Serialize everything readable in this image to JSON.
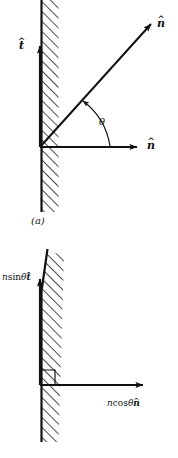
{
  "figure": {
    "caption_a": "(a)",
    "panels": [
      {
        "id": "panel-a",
        "name": "normal-vector-and-angle-diagram",
        "caption": "(a)",
        "wall": {
          "name": "hatched-wall",
          "orientation": "vertical",
          "hatch_angle_deg": 45,
          "line_color": "#111111"
        },
        "vectors": [
          {
            "name": "tangent-unit-vector",
            "label_base": "t",
            "label_accent": "^",
            "direction": "up",
            "from": [
              40,
              147
            ],
            "to": [
              40,
              42
            ]
          },
          {
            "name": "normal-unit-vector",
            "label_base": "n",
            "label_accent": "^",
            "direction": "right",
            "from": [
              40,
              147
            ],
            "to": [
              142,
              147
            ]
          },
          {
            "name": "oblique-normal-vector",
            "label_base": "n",
            "label_accent": "^",
            "direction": "up-right",
            "from": [
              40,
              147
            ],
            "to": [
              155,
              20
            ],
            "angle_deg": 48
          }
        ],
        "angle_marker": {
          "name": "theta-arc",
          "label": "θ",
          "between": [
            "normal-unit-vector",
            "oblique-normal-vector"
          ],
          "value_deg": 48
        }
      },
      {
        "id": "panel-b",
        "name": "component-decomposition-diagram",
        "caption": "",
        "wall": {
          "name": "hatched-wall",
          "orientation": "vertical",
          "hatch_angle_deg": 45,
          "line_color": "#111111"
        },
        "right_angle_marker": {
          "name": "right-angle-marker",
          "at": [
            40,
            385
          ],
          "size": 15
        },
        "vectors": [
          {
            "name": "tangential-component-vector",
            "label_prefix": "n",
            "label_function": "sin",
            "label_angle": "θ",
            "label_base": "t",
            "label_accent": "^",
            "direction": "up",
            "from": [
              40,
              385
            ],
            "to": [
              40,
              275
            ]
          },
          {
            "name": "normal-component-vector",
            "label_prefix": "n",
            "label_function": "cos",
            "label_angle": "θ",
            "label_base": "n",
            "label_accent": "^",
            "direction": "right",
            "from": [
              40,
              385
            ],
            "to": [
              148,
              385
            ]
          }
        ]
      }
    ]
  },
  "labels": {
    "n_hat_diagonal": {
      "base": "n",
      "accent": "^"
    },
    "t_hat_vertical": {
      "base": "t",
      "accent": "^"
    },
    "n_hat_horizontal": {
      "base": "n",
      "accent": "^"
    },
    "theta": "θ",
    "caption_a": "(a)",
    "n_sin_theta_t": {
      "scalar": "n",
      "func": "sin",
      "angle": "θ",
      "base": "t",
      "accent": "^"
    },
    "n_cos_theta_n": {
      "scalar": "n",
      "func": "cos",
      "angle": "θ",
      "base": "n",
      "accent": "^"
    }
  },
  "colors": {
    "ink": "#111111",
    "background": "#ffffff"
  }
}
